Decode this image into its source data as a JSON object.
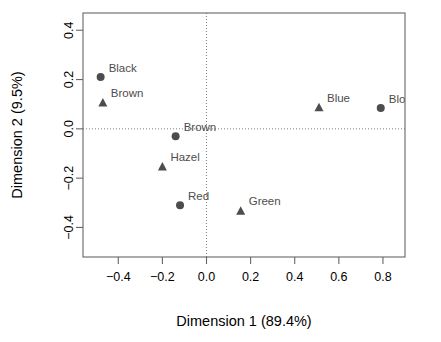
{
  "figure": {
    "clipped_header_text": "",
    "background_color": "#ffffff",
    "marker_color": "#4d4d4d",
    "label_color": "#4d4d4d",
    "frame_color": "#666666"
  },
  "chart_data": {
    "type": "scatter",
    "title": "",
    "xlabel": "Dimension 1 (89.4%)",
    "ylabel": "Dimension 2 (9.5%)",
    "xlim": [
      -0.56,
      0.9
    ],
    "ylim": [
      -0.52,
      0.47
    ],
    "xticks": [
      -0.4,
      -0.2,
      0.0,
      0.2,
      0.4,
      0.6,
      0.8
    ],
    "xticklabels": [
      "-0.4",
      "-0.2",
      "0.0",
      "0.2",
      "0.4",
      "0.6",
      "0.8"
    ],
    "yticks": [
      0.4,
      0.2,
      0.0,
      -0.2,
      -0.4
    ],
    "yticklabels": [
      "0.4",
      "0.2",
      "0.0",
      "-0.2",
      "-0.4"
    ],
    "grid": false,
    "reference_lines": [
      {
        "axis": "horizontal",
        "value": 0.0,
        "style": "dotted"
      },
      {
        "axis": "vertical",
        "value": 0.0,
        "style": "dotted"
      }
    ],
    "legend": null,
    "series": [
      {
        "name": "Hair",
        "marker": "circle",
        "points": [
          {
            "label": "Black",
            "x": -0.48,
            "y": 0.21,
            "label_dx": 8,
            "label_dy": -5
          },
          {
            "label": "Brown",
            "x": -0.14,
            "y": -0.03,
            "label_dx": 8,
            "label_dy": -5
          },
          {
            "label": "Red",
            "x": -0.12,
            "y": -0.31,
            "label_dx": 8,
            "label_dy": -5
          },
          {
            "label": "Blond",
            "x": 0.79,
            "y": 0.085,
            "label_dx": 8,
            "label_dy": -5
          }
        ]
      },
      {
        "name": "Eye",
        "marker": "triangle",
        "points": [
          {
            "label": "Brown",
            "x": -0.47,
            "y": 0.105,
            "label_dx": 8,
            "label_dy": -6
          },
          {
            "label": "Hazel",
            "x": -0.2,
            "y": -0.155,
            "label_dx": 8,
            "label_dy": -6
          },
          {
            "label": "Green",
            "x": 0.155,
            "y": -0.335,
            "label_dx": 8,
            "label_dy": -6
          },
          {
            "label": "Blue",
            "x": 0.51,
            "y": 0.085,
            "label_dx": 8,
            "label_dy": -6
          }
        ]
      }
    ]
  }
}
